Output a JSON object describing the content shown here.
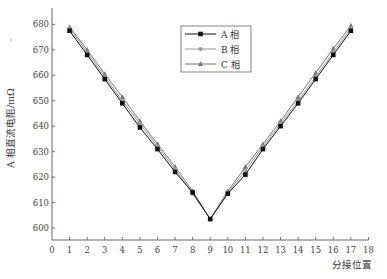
{
  "chart_data": {
    "type": "line",
    "title": "",
    "xlabel": "分接位置",
    "ylabel": "A 相直流电阻/mΩ",
    "xlim": [
      0,
      18
    ],
    "ylim": [
      595,
      683
    ],
    "x_ticks": [
      0,
      1,
      2,
      3,
      4,
      5,
      6,
      7,
      8,
      9,
      10,
      11,
      12,
      13,
      14,
      15,
      16,
      17,
      18
    ],
    "y_ticks": [
      600,
      610,
      620,
      630,
      640,
      650,
      660,
      670,
      680
    ],
    "grid": false,
    "legend_position": "upper center",
    "x": [
      1,
      2,
      3,
      4,
      5,
      6,
      7,
      8,
      9,
      10,
      11,
      12,
      13,
      14,
      15,
      16,
      17
    ],
    "series": [
      {
        "name": "A 相",
        "marker": "square",
        "color": "#111111",
        "values": [
          677.5,
          668,
          658.5,
          649,
          639.5,
          631,
          622,
          614,
          603.5,
          613.5,
          621,
          631,
          640,
          649,
          658.5,
          668,
          677.5
        ]
      },
      {
        "name": "B 相",
        "marker": "circle",
        "color": "#999999",
        "values": [
          678.5,
          669,
          659.5,
          650,
          641,
          632,
          623,
          613.5,
          603.5,
          614,
          622.5,
          632,
          641,
          650,
          659.5,
          669,
          678.5
        ]
      },
      {
        "name": "C 相",
        "marker": "triangle",
        "color": "#777777",
        "values": [
          679,
          670,
          660.5,
          651.5,
          642,
          633,
          624,
          614.5,
          603.5,
          614.5,
          624,
          633,
          642,
          651.5,
          661,
          670.5,
          679.5
        ]
      }
    ]
  }
}
